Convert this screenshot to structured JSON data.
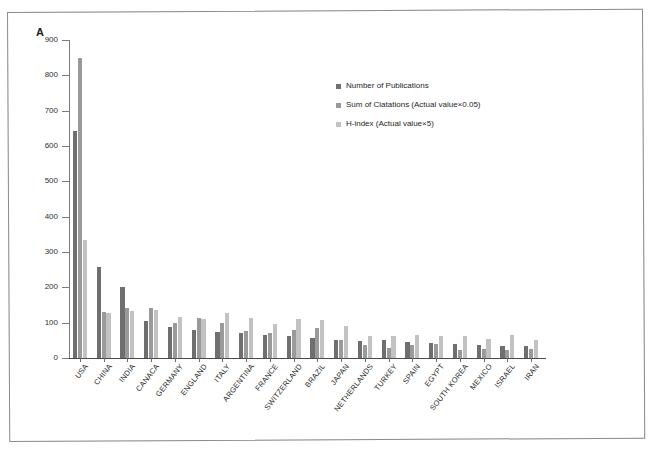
{
  "figure": {
    "panel_letter": "A"
  },
  "chart_data": {
    "type": "bar",
    "title": "",
    "xlabel": "",
    "ylabel": "",
    "ylim": [
      0,
      900
    ],
    "y_ticks": [
      0,
      100,
      200,
      300,
      400,
      500,
      600,
      700,
      800,
      900
    ],
    "grid": false,
    "legend_position": "upper-right-inside",
    "categories": [
      "USA",
      "CHINA",
      "INDIA",
      "CANACA",
      "GERMANY",
      "ENGLAND",
      "ITALY",
      "ARGENTINA",
      "FRANCE",
      "SWITZERLAND",
      "BRAZIL",
      "JAPAN",
      "NETHERLANDS",
      "TURKEY",
      "SPAIN",
      "EGYPT",
      "SOUTH KOREA",
      "MEXICO",
      "ISRAEL",
      "IRAN"
    ],
    "series": [
      {
        "name": "Number of Publications",
        "color": "#6f6f6f",
        "values": [
          643,
          258,
          202,
          106,
          88,
          79,
          73,
          70,
          66,
          62,
          56,
          52,
          47,
          50,
          45,
          42,
          40,
          36,
          35,
          33
        ]
      },
      {
        "name": "Sum of Ciatations (Actual value×0.05)",
        "color": "#9a9a9a",
        "values": [
          848,
          130,
          141,
          142,
          98,
          112,
          100,
          77,
          72,
          80,
          86,
          52,
          38,
          29,
          37,
          40,
          24,
          26,
          24,
          25
        ]
      },
      {
        "name": "H-index (Actual value×5)",
        "color": "#c2c2c2",
        "values": [
          333,
          128,
          134,
          135,
          116,
          110,
          128,
          113,
          95,
          110,
          108,
          90,
          63,
          63,
          64,
          63,
          63,
          54,
          65,
          50
        ]
      }
    ]
  },
  "legend": {
    "items": [
      {
        "label": "Number of Publications",
        "color": "#6f6f6f"
      },
      {
        "label": "Sum of Ciatations (Actual value×0.05)",
        "color": "#9a9a9a"
      },
      {
        "label": "H-index (Actual value×5)",
        "color": "#c2c2c2"
      }
    ]
  }
}
